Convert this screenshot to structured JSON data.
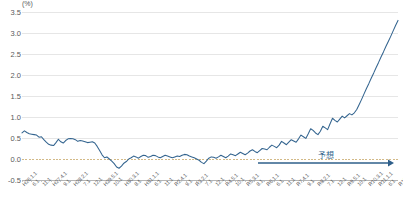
{
  "chart_data": {
    "type": "line",
    "title": "",
    "subtitle": "",
    "xlabel": "",
    "ylabel": "",
    "unit_label": "(%)",
    "ylim": [
      -0.5,
      3.5
    ],
    "ytick_values": [
      3.5,
      3.0,
      2.5,
      2.0,
      1.5,
      1.0,
      0.5,
      0.0,
      -0.5
    ],
    "ytick_labels": [
      "3.5",
      "3.0",
      "2.5",
      "2.0",
      "1.5",
      "1.0",
      "0.5",
      "0.0",
      "-0.5"
    ],
    "grid": true,
    "grid_axis": "y",
    "legend": "none",
    "line_color": "#33648f",
    "zero_line_color": "#c8a96a",
    "xtick_labels": [
      "H26.1.1",
      "6.1",
      "11.1",
      "H27.4.1",
      "9.1",
      "H28.2.1",
      "7.1",
      "12.1",
      "H29.5.1",
      "10.1",
      "H30.3.1",
      "8.1",
      "H31.1.1",
      "6.1",
      "11.1",
      "R2.4.1",
      "9.1",
      "R3.2.1",
      "7.1",
      "12.1",
      "R4.5.1",
      "10.1",
      "R5.3.1",
      "8.1",
      "R6.1.1",
      "6.1",
      "11.1",
      "R7.4.1",
      "9.1",
      "R8.2.1",
      "7.1",
      "12.1",
      "R9.5.1",
      "10.1",
      "R10.3.1",
      "R11.1.1",
      "6.1",
      "R12.4.1"
    ],
    "xtick_positions_pct": [
      0.8,
      4.1,
      7.4,
      10.7,
      14.0,
      17.3,
      20.6,
      23.9,
      27.2,
      30.5,
      33.8,
      37.1,
      40.4,
      43.7,
      47.0,
      50.3,
      53.6,
      56.9,
      60.2,
      63.5,
      66.8,
      70.1,
      73.4,
      76.7,
      80.0,
      83.3,
      86.6,
      89.9,
      93.2,
      96.5,
      99.0,
      99.3,
      99.5,
      99.7,
      99.8,
      99.85,
      99.9,
      99.95
    ],
    "annotation": {
      "text": "予想",
      "arrow": "rightwards-arrow",
      "arrow_color": "#2e5f8a",
      "label_color": "#2e5f8a"
    },
    "series": [
      {
        "name": "rate",
        "values": [
          0.62,
          0.67,
          0.63,
          0.6,
          0.59,
          0.58,
          0.57,
          0.52,
          0.53,
          0.46,
          0.4,
          0.35,
          0.33,
          0.32,
          0.39,
          0.47,
          0.41,
          0.38,
          0.44,
          0.48,
          0.49,
          0.48,
          0.46,
          0.42,
          0.44,
          0.43,
          0.41,
          0.39,
          0.4,
          0.41,
          0.38,
          0.3,
          0.2,
          0.1,
          0.03,
          0.05,
          0.0,
          -0.05,
          -0.11,
          -0.19,
          -0.22,
          -0.17,
          -0.1,
          -0.06,
          0.0,
          0.03,
          0.07,
          0.05,
          0.02,
          0.06,
          0.09,
          0.08,
          0.04,
          0.06,
          0.09,
          0.08,
          0.05,
          0.03,
          0.06,
          0.09,
          0.07,
          0.05,
          0.03,
          0.05,
          0.07,
          0.06,
          0.09,
          0.11,
          0.1,
          0.07,
          0.05,
          0.03,
          0.0,
          -0.03,
          -0.08,
          -0.11,
          -0.05,
          0.02,
          0.05,
          0.04,
          0.02,
          0.05,
          0.09,
          0.06,
          0.03,
          0.07,
          0.12,
          0.1,
          0.08,
          0.12,
          0.16,
          0.13,
          0.1,
          0.14,
          0.19,
          0.22,
          0.18,
          0.15,
          0.2,
          0.25,
          0.24,
          0.22,
          0.28,
          0.33,
          0.3,
          0.27,
          0.33,
          0.42,
          0.38,
          0.34,
          0.4,
          0.46,
          0.43,
          0.4,
          0.48,
          0.57,
          0.53,
          0.49,
          0.6,
          0.72,
          0.68,
          0.62,
          0.58,
          0.66,
          0.78,
          0.74,
          0.7,
          0.84,
          0.97,
          0.92,
          0.88,
          0.95,
          1.02,
          0.98,
          1.03,
          1.08,
          1.05,
          1.1,
          1.18,
          1.3,
          1.42,
          1.55,
          1.68,
          1.8,
          1.93,
          2.05,
          2.18,
          2.3,
          2.43,
          2.55,
          2.68,
          2.8,
          2.92,
          3.05,
          3.18,
          3.3
        ]
      }
    ]
  }
}
